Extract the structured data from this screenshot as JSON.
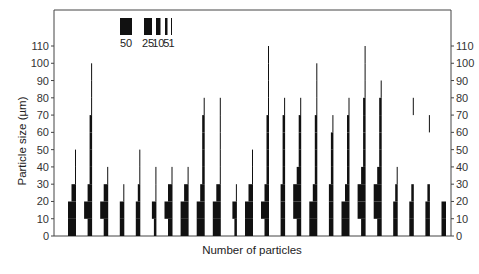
{
  "chart_data": {
    "type": "bar",
    "subtype": "kite-histogram-series",
    "title": "",
    "xlabel": "Number of particles",
    "ylabel": "Particle size (µm)",
    "ylim": [
      0,
      120
    ],
    "y_ticks": [
      0,
      10,
      20,
      30,
      40,
      50,
      60,
      70,
      80,
      90,
      100,
      110
    ],
    "y_tick_labels": [
      "0",
      "10",
      "20",
      "30",
      "40",
      "50",
      "60",
      "70",
      "80",
      "90",
      "100",
      "110"
    ],
    "right_axis_ticks_mirror": true,
    "grid": false,
    "bin_width": 10,
    "legend": {
      "placement": "top-left",
      "title": "",
      "entries": [
        {
          "label": "50",
          "count": 50
        },
        {
          "label": "25",
          "count": 25
        },
        {
          "label": "10",
          "count": 10
        },
        {
          "label": "5",
          "count": 5
        },
        {
          "label": "1",
          "count": 1
        }
      ]
    },
    "series_note": "Each histogram shows number of particles per 10 µm size bin; bar width encodes count",
    "series": [
      {
        "name": "h1",
        "bins": [
          25,
          25,
          10,
          1,
          1
        ]
      },
      {
        "name": "h2",
        "bins": [
          10,
          25,
          10,
          5,
          5,
          5,
          5,
          1,
          1,
          1
        ]
      },
      {
        "name": "h3",
        "bins": [
          10,
          25,
          10,
          1
        ]
      },
      {
        "name": "h4",
        "bins": [
          10,
          10,
          1
        ]
      },
      {
        "name": "h5",
        "bins": [
          10,
          10,
          5,
          1,
          1
        ]
      },
      {
        "name": "h6",
        "bins": [
          5,
          10,
          1,
          1
        ]
      },
      {
        "name": "h7",
        "bins": [
          10,
          25,
          10,
          1
        ]
      },
      {
        "name": "h8",
        "bins": [
          25,
          25,
          10,
          1
        ]
      },
      {
        "name": "h9",
        "bins": [
          25,
          25,
          10,
          5,
          5,
          5,
          5,
          1
        ]
      },
      {
        "name": "h10",
        "bins": [
          25,
          25,
          10,
          1,
          1,
          1,
          1,
          1
        ]
      },
      {
        "name": "h11",
        "bins": [
          5,
          10,
          1
        ]
      },
      {
        "name": "h12",
        "bins": [
          25,
          25,
          10,
          1,
          1
        ]
      },
      {
        "name": "h13",
        "bins": [
          10,
          25,
          10,
          5,
          5,
          5,
          5,
          1,
          1,
          1,
          1
        ]
      },
      {
        "name": "h14",
        "bins": [
          10,
          10,
          10,
          5,
          5,
          5,
          5,
          1
        ]
      },
      {
        "name": "h15",
        "bins": [
          10,
          25,
          25,
          10,
          5,
          5,
          5,
          1
        ]
      },
      {
        "name": "h16",
        "bins": [
          25,
          25,
          10,
          5,
          5,
          5,
          5,
          1,
          1,
          1
        ]
      },
      {
        "name": "h17",
        "bins": [
          10,
          10,
          10,
          5,
          5,
          5,
          1
        ]
      },
      {
        "name": "h18",
        "bins": [
          25,
          25,
          10,
          5,
          5,
          5,
          5,
          1
        ]
      },
      {
        "name": "h19",
        "bins": [
          10,
          25,
          25,
          10,
          5,
          5,
          5,
          5,
          1,
          1,
          1
        ]
      },
      {
        "name": "h20",
        "bins": [
          10,
          25,
          25,
          10,
          5,
          5,
          5,
          5,
          1
        ]
      },
      {
        "name": "h21",
        "bins": [
          10,
          10,
          5,
          1
        ]
      },
      {
        "name": "h22",
        "bins": [
          10,
          10,
          5,
          0,
          0,
          0,
          0,
          1
        ]
      },
      {
        "name": "h23",
        "bins": [
          10,
          10,
          5,
          0,
          0,
          0,
          1
        ]
      },
      {
        "name": "h24",
        "bins": [
          10,
          10
        ]
      }
    ]
  }
}
